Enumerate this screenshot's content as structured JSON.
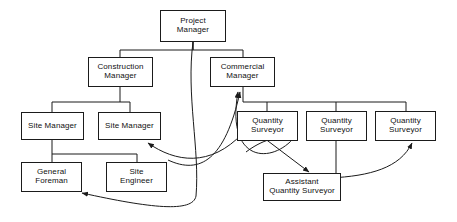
{
  "diagram": {
    "line_color": "#1b1b1b",
    "box_fill": "#ffffff",
    "text_color": "#111111",
    "nodes": [
      {
        "id": "project-manager",
        "label": "Project\nManager",
        "x": 160,
        "y": 10,
        "w": 66,
        "h": 32
      },
      {
        "id": "construction-manager",
        "label": "Construction\nManager",
        "x": 88,
        "y": 57,
        "w": 65,
        "h": 30
      },
      {
        "id": "commercial-manager",
        "label": "Commercial\nManager",
        "x": 210,
        "y": 57,
        "w": 65,
        "h": 30
      },
      {
        "id": "site-manager-1",
        "label": "Site Manager",
        "x": 21,
        "y": 112,
        "w": 63,
        "h": 28
      },
      {
        "id": "site-manager-2",
        "label": "Site Manager",
        "x": 98,
        "y": 112,
        "w": 63,
        "h": 28
      },
      {
        "id": "quantity-surveyor-1",
        "label": "Quantity\nSurveyor",
        "x": 237,
        "y": 111,
        "w": 61,
        "h": 30
      },
      {
        "id": "quantity-surveyor-2",
        "label": "Quantity\nSurveyor",
        "x": 306,
        "y": 111,
        "w": 61,
        "h": 30
      },
      {
        "id": "quantity-surveyor-3",
        "label": "Quantity\nSurveyor",
        "x": 375,
        "y": 111,
        "w": 61,
        "h": 30
      },
      {
        "id": "general-foreman",
        "label": "General\nForeman",
        "x": 21,
        "y": 162,
        "w": 61,
        "h": 30
      },
      {
        "id": "site-engineer",
        "label": "Site\nEngineer",
        "x": 106,
        "y": 162,
        "w": 61,
        "h": 30
      },
      {
        "id": "assistant-quantity-surveyor",
        "label": "Assistant\nQuantity Surveyor",
        "x": 263,
        "y": 173,
        "w": 78,
        "h": 28
      }
    ],
    "connectors": [
      {
        "id": "pm-to-construction-manager",
        "type": "orthogonal",
        "d": "M 193 42 L 193 50 L 120 50 L 120 57"
      },
      {
        "id": "pm-to-commercial-manager",
        "type": "orthogonal",
        "d": "M 193 42 L 193 50 L 243 50 L 243 57"
      },
      {
        "id": "construction-to-site-managers-trunk",
        "type": "orthogonal",
        "d": "M 120 87 L 120 102 L 52 102 L 52 112"
      },
      {
        "id": "construction-to-site-manager-2",
        "type": "orthogonal",
        "d": "M 120 102 L 130 102 L 130 112"
      },
      {
        "id": "site-manager-1-to-subordinates-trunk",
        "type": "orthogonal",
        "d": "M 52 140 L 52 154 L 137 154 L 137 162"
      },
      {
        "id": "site-manager-1-to-general-foreman",
        "type": "orthogonal",
        "d": "M 52 154 L 52 162"
      },
      {
        "id": "commercial-to-qs-trunk",
        "type": "orthogonal",
        "d": "M 243 87 L 243 102 L 406 102 L 406 111"
      },
      {
        "id": "commercial-to-qs-1",
        "type": "orthogonal",
        "d": "M 267 102 L 267 111"
      },
      {
        "id": "commercial-to-qs-2",
        "type": "orthogonal",
        "d": "M 336 102 L 336 111"
      },
      {
        "id": "qs-2-to-assistant-qs",
        "type": "straight",
        "d": "M 336 141 L 336 173"
      },
      {
        "id": "pm-to-general-foreman-dotted-line",
        "type": "curve",
        "arrow": true,
        "d": "M 193 42 C 186 95, 200 150, 196 196 C 193 213, 150 208, 82 193"
      },
      {
        "id": "qs-1-to-commercial-manager-feedback",
        "type": "curve",
        "arrow": true,
        "d": "M 297 134 C 275 165, 225 165, 238 92"
      },
      {
        "id": "site-engineer-area-to-commercial-manager-feedback",
        "type": "curve",
        "arrow": true,
        "d": "M 168 160 C 200 175, 225 160, 240 92"
      },
      {
        "id": "feedback-to-site-manager-2",
        "type": "curve",
        "arrow": true,
        "d": "M 243 133 C 210 168, 175 162, 148 143"
      },
      {
        "id": "assistant-qs-to-qs-1",
        "type": "curve",
        "arrow": true,
        "d": "M 246 152 C 262 140, 278 135, 293 139"
      },
      {
        "id": "qs-1-to-assistant-qs",
        "type": "straight",
        "arrow": true,
        "d": "M 264 138 L 309 172"
      },
      {
        "id": "assistant-qs-to-qs-3",
        "type": "curve",
        "arrow": true,
        "d": "M 330 178 C 370 176, 400 168, 412 143"
      }
    ]
  }
}
